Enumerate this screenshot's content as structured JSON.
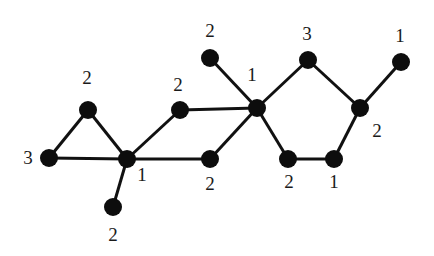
{
  "graph": {
    "nodes": [
      {
        "id": "a",
        "x": 88,
        "y": 110,
        "label": "2",
        "lx": 87,
        "ly": 80
      },
      {
        "id": "b",
        "x": 49,
        "y": 158,
        "label": "3",
        "lx": 28,
        "ly": 160
      },
      {
        "id": "c",
        "x": 127,
        "y": 159,
        "label": "1",
        "lx": 142,
        "ly": 177
      },
      {
        "id": "d",
        "x": 113,
        "y": 207,
        "label": "2",
        "lx": 113,
        "ly": 237
      },
      {
        "id": "e",
        "x": 180,
        "y": 110,
        "label": "2",
        "lx": 178,
        "ly": 87
      },
      {
        "id": "f",
        "x": 210,
        "y": 159,
        "label": "2",
        "lx": 210,
        "ly": 186
      },
      {
        "id": "g",
        "x": 257,
        "y": 108,
        "label": "1",
        "lx": 252,
        "ly": 77
      },
      {
        "id": "h",
        "x": 210,
        "y": 58,
        "label": "2",
        "lx": 210,
        "ly": 33
      },
      {
        "id": "i",
        "x": 308,
        "y": 60,
        "label": "3",
        "lx": 307,
        "ly": 36
      },
      {
        "id": "j",
        "x": 360,
        "y": 108,
        "label": "2",
        "lx": 377,
        "ly": 133
      },
      {
        "id": "k",
        "x": 401,
        "y": 62,
        "label": "1",
        "lx": 400,
        "ly": 38
      },
      {
        "id": "l",
        "x": 288,
        "y": 159,
        "label": "2",
        "lx": 289,
        "ly": 184
      },
      {
        "id": "m",
        "x": 334,
        "y": 159,
        "label": "1",
        "lx": 334,
        "ly": 184
      }
    ],
    "edges": [
      [
        "a",
        "b"
      ],
      [
        "a",
        "c"
      ],
      [
        "b",
        "c"
      ],
      [
        "c",
        "d"
      ],
      [
        "c",
        "e"
      ],
      [
        "c",
        "f"
      ],
      [
        "e",
        "g"
      ],
      [
        "f",
        "g"
      ],
      [
        "h",
        "g"
      ],
      [
        "g",
        "i"
      ],
      [
        "i",
        "j"
      ],
      [
        "j",
        "k"
      ],
      [
        "g",
        "l"
      ],
      [
        "l",
        "m"
      ],
      [
        "m",
        "j"
      ]
    ],
    "node_radius": 9,
    "node_color": "#0d0d0d",
    "edge_color": "#111111"
  }
}
